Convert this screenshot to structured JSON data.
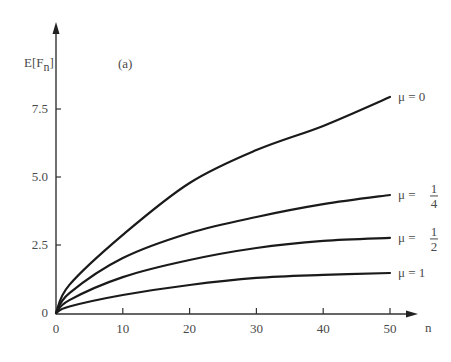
{
  "chart_data": {
    "type": "line",
    "title": "",
    "panel_label": "(a)",
    "xlabel": "n",
    "ylabel": "E[F_n]",
    "ylabel_main": "E[F",
    "ylabel_sub": "n",
    "ylabel_close": "]",
    "xlim": [
      0,
      50
    ],
    "ylim": [
      0,
      8.5
    ],
    "grid": false,
    "legend_position": "inline-right",
    "x_ticks": [
      0,
      10,
      20,
      30,
      40,
      50
    ],
    "x_tick_labels": [
      "0",
      "10",
      "20",
      "30",
      "40",
      "50"
    ],
    "y_ticks": [
      0,
      2.5,
      5.0,
      7.5
    ],
    "y_tick_labels": [
      "0",
      "2.5",
      "5.0",
      "7.5"
    ],
    "x": [
      0,
      10,
      20,
      30,
      40,
      50
    ],
    "series": [
      {
        "name": "μ = 0",
        "label_prefix": "μ  =  ",
        "label_value": "0",
        "fraction": null,
        "values": [
          0,
          2.87,
          4.78,
          5.99,
          6.88,
          7.94
        ]
      },
      {
        "name": "μ = 1/4",
        "label_prefix": "μ  =  ",
        "label_value": "",
        "fraction": {
          "num": "1",
          "den": "4"
        },
        "values": [
          0,
          2.02,
          2.94,
          3.53,
          4.0,
          4.34
        ]
      },
      {
        "name": "μ = 1/2",
        "label_prefix": "μ  =  ",
        "label_value": "",
        "fraction": {
          "num": "1",
          "den": "2"
        },
        "values": [
          0,
          1.32,
          1.95,
          2.39,
          2.65,
          2.76
        ]
      },
      {
        "name": "μ = 1",
        "label_prefix": "μ  =  ",
        "label_value": "1",
        "fraction": null,
        "values": [
          0,
          0.66,
          1.03,
          1.29,
          1.4,
          1.47
        ]
      }
    ]
  }
}
